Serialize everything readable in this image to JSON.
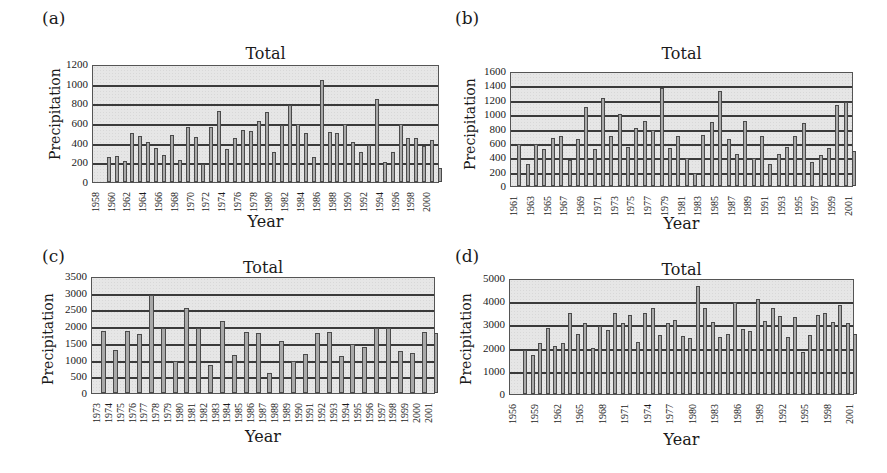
{
  "panels": [
    {
      "label": "(a)",
      "title": "Total",
      "xlabel": "Year",
      "ylabel": "Precipitation"
    },
    {
      "label": "(b)",
      "title": "Total",
      "xlabel": "Year",
      "ylabel": "Precipitation"
    },
    {
      "label": "(c)",
      "title": "Total",
      "xlabel": "Year",
      "ylabel": "Precipitation"
    },
    {
      "label": "(d)",
      "title": "Total",
      "xlabel": "Year",
      "ylabel": "Precipitation"
    }
  ],
  "chart_data": [
    {
      "panel": "(a)",
      "type": "bar",
      "title": "Total",
      "xlabel": "Year",
      "ylabel": "Precipitation",
      "ylim": [
        0,
        1200
      ],
      "yticks": [
        0,
        200,
        400,
        600,
        800,
        1000,
        1200
      ],
      "grid": true,
      "legend": null,
      "xtick_labels": [
        "1958",
        "1960",
        "1962",
        "1964",
        "1966",
        "1968",
        "1970",
        "1972",
        "1974",
        "1976",
        "1978",
        "1980",
        "1982",
        "1984",
        "1986",
        "1988",
        "1990",
        "1992",
        "1994",
        "1996",
        "1998",
        "2000"
      ],
      "categories": [
        1959,
        1960,
        1961,
        1962,
        1963,
        1964,
        1965,
        1966,
        1967,
        1968,
        1969,
        1970,
        1971,
        1972,
        1973,
        1974,
        1975,
        1976,
        1977,
        1978,
        1979,
        1980,
        1981,
        1982,
        1983,
        1984,
        1985,
        1986,
        1987,
        1988,
        1989,
        1990,
        1991,
        1992,
        1993,
        1994,
        1995,
        1996,
        1997,
        1998,
        1999,
        2000,
        2001
      ],
      "values": [
        250,
        265,
        215,
        495,
        470,
        410,
        345,
        270,
        475,
        225,
        555,
        455,
        185,
        555,
        720,
        335,
        450,
        525,
        515,
        625,
        710,
        305,
        580,
        780,
        590,
        495,
        255,
        1040,
        505,
        500,
        585,
        410,
        305,
        375,
        840,
        205,
        310,
        585,
        445,
        450,
        370,
        425,
        140
      ]
    },
    {
      "panel": "(b)",
      "type": "bar",
      "title": "Total",
      "xlabel": "Year",
      "ylabel": "Precipitation",
      "ylim": [
        0,
        1600
      ],
      "yticks": [
        0,
        200,
        400,
        600,
        800,
        1000,
        1200,
        1400,
        1600
      ],
      "grid": true,
      "legend": null,
      "xtick_labels": [
        "1961",
        "1963",
        "1965",
        "1967",
        "1969",
        "1971",
        "1973",
        "1975",
        "1977",
        "1979",
        "1981",
        "1983",
        "1985",
        "1987",
        "1989",
        "1991",
        "1993",
        "1995",
        "1997",
        "1999",
        "2001"
      ],
      "categories": [
        1961,
        1962,
        1963,
        1964,
        1965,
        1966,
        1967,
        1968,
        1969,
        1970,
        1971,
        1972,
        1973,
        1974,
        1975,
        1976,
        1977,
        1978,
        1979,
        1980,
        1981,
        1982,
        1983,
        1984,
        1985,
        1986,
        1987,
        1988,
        1989,
        1990,
        1991,
        1992,
        1993,
        1994,
        1995,
        1996,
        1997,
        1998,
        1999,
        2000,
        2001
      ],
      "values": [
        580,
        300,
        590,
        510,
        665,
        690,
        360,
        650,
        1100,
        510,
        1220,
        700,
        1000,
        545,
        810,
        905,
        785,
        1370,
        525,
        700,
        395,
        180,
        710,
        890,
        1325,
        660,
        440,
        905,
        395,
        700,
        310,
        450,
        545,
        700,
        870,
        330,
        435,
        525,
        1125,
        1170,
        490
      ]
    },
    {
      "panel": "(c)",
      "type": "bar",
      "title": "Total",
      "xlabel": "Year",
      "ylabel": "Precipitation",
      "ylim": [
        0,
        3500
      ],
      "yticks": [
        0,
        500,
        1000,
        1500,
        2000,
        2500,
        3000,
        3500
      ],
      "grid": true,
      "legend": null,
      "xtick_labels": [
        "1973",
        "1974",
        "1975",
        "1976",
        "1977",
        "1978",
        "1979",
        "1980",
        "1981",
        "1982",
        "1983",
        "1984",
        "1985",
        "1986",
        "1987",
        "1988",
        "1989",
        "1990",
        "1991",
        "1992",
        "1993",
        "1994",
        "1995",
        "1996",
        "1997",
        "1998",
        "1999",
        "2000",
        "2001"
      ],
      "categories": [
        1973,
        1974,
        1975,
        1976,
        1977,
        1978,
        1979,
        1980,
        1981,
        1982,
        1983,
        1984,
        1985,
        1986,
        1987,
        1988,
        1989,
        1990,
        1991,
        1992,
        1993,
        1994,
        1995,
        1996,
        1997,
        1998,
        1999,
        2000,
        2001
      ],
      "values": [
        1850,
        1280,
        1850,
        1760,
        2920,
        1950,
        960,
        2540,
        1930,
        830,
        2150,
        1140,
        1820,
        1790,
        600,
        1560,
        950,
        1160,
        1790,
        1840,
        1100,
        1470,
        1370,
        1950,
        1930,
        1270,
        1210,
        1820,
        1790
      ]
    },
    {
      "panel": "(d)",
      "type": "bar",
      "title": "Total",
      "xlabel": "Year",
      "ylabel": "Precipitation",
      "ylim": [
        0,
        5000
      ],
      "yticks": [
        0,
        1000,
        2000,
        3000,
        4000,
        5000
      ],
      "grid": true,
      "legend": null,
      "xtick_labels": [
        "1956",
        "1959",
        "1962",
        "1965",
        "1968",
        "1971",
        "1974",
        "1977",
        "1980",
        "1983",
        "1986",
        "1989",
        "1992",
        "1995",
        "1998",
        "2001"
      ],
      "categories": [
        1957,
        1958,
        1959,
        1960,
        1961,
        1962,
        1963,
        1964,
        1965,
        1966,
        1967,
        1968,
        1969,
        1970,
        1971,
        1972,
        1973,
        1974,
        1975,
        1976,
        1977,
        1978,
        1979,
        1980,
        1981,
        1982,
        1983,
        1984,
        1985,
        1986,
        1987,
        1988,
        1989,
        1990,
        1991,
        1992,
        1993,
        1994,
        1995,
        1996,
        1997,
        1998,
        1999,
        2000,
        2001
      ],
      "values": [
        1900,
        1700,
        2200,
        2850,
        2050,
        2200,
        3500,
        2600,
        3050,
        2000,
        2950,
        2750,
        3500,
        3050,
        3400,
        2250,
        3500,
        3700,
        2550,
        3050,
        3200,
        2500,
        2400,
        4650,
        3700,
        3100,
        2450,
        2600,
        3950,
        2800,
        2700,
        4100,
        3150,
        3700,
        3350,
        2450,
        3300,
        1800,
        2550,
        3400,
        3500,
        3100,
        3850,
        3050,
        2600
      ]
    }
  ]
}
